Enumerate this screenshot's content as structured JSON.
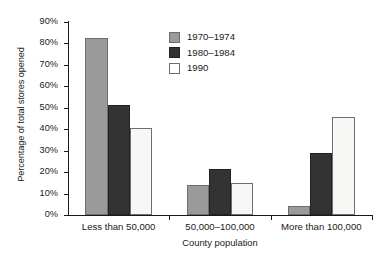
{
  "chart_data": {
    "type": "bar",
    "title": "",
    "subtitle": "",
    "xlabel": "County population",
    "ylabel": "Percentage of total stores opened",
    "categories": [
      "Less than 50,000",
      "50,000–100,000",
      "More than 100,000"
    ],
    "series": [
      {
        "name": "1970–1974",
        "color": "#9a9a9a",
        "values": [
          82.5,
          14.0,
          4.0
        ]
      },
      {
        "name": "1980–1984",
        "color": "#333333",
        "values": [
          51.5,
          21.5,
          29.0
        ]
      },
      {
        "name": "1990",
        "color": "#ffffff",
        "values": [
          40.5,
          15.0,
          45.5
        ]
      }
    ],
    "ylim": [
      0,
      90
    ],
    "ytick_values": [
      0,
      10,
      20,
      30,
      40,
      50,
      60,
      70,
      80,
      90
    ],
    "ytick_labels": [
      "0%",
      "10%",
      "20%",
      "30%",
      "40%",
      "50%",
      "60%",
      "70%",
      "80%",
      "90%"
    ],
    "grid": false,
    "legend_position": "upper-center",
    "bar_group_width_fraction": 0.66
  },
  "legend": {
    "entries": [
      {
        "label": "1970–1974"
      },
      {
        "label": "1980–1984"
      },
      {
        "label": "1990"
      }
    ]
  },
  "axes": {
    "y_title": "Percentage of total stores opened",
    "x_title": "County population"
  }
}
